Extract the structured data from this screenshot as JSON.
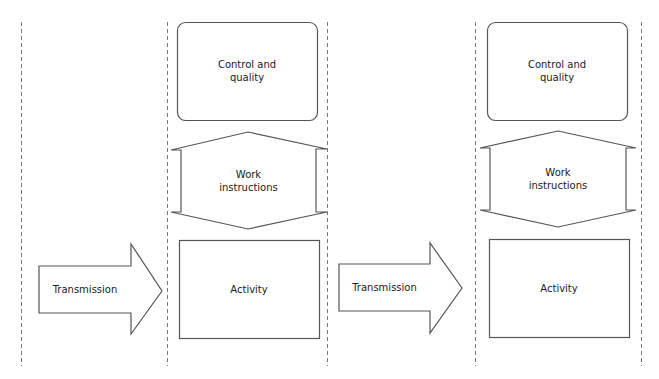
{
  "diagram": {
    "colors": {
      "stroke": "#555555",
      "dashed": "#777777",
      "text": "#1a1a1a",
      "background": "#ffffff"
    },
    "columns": [
      {
        "control": {
          "line1": "Control and",
          "line2": "quality"
        },
        "work": {
          "line1": "Work",
          "line2": "instructions"
        },
        "activity": {
          "label": "Activity"
        }
      },
      {
        "control": {
          "line1": "Control and",
          "line2": "quality"
        },
        "work": {
          "line1": "Work",
          "line2": "instructions"
        },
        "activity": {
          "label": "Activity"
        }
      }
    ],
    "arrows": [
      {
        "label": "Transmission"
      },
      {
        "label": "Transmission"
      }
    ]
  }
}
